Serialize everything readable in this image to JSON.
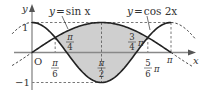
{
  "figure": {
    "type": "function-graph",
    "curves": [
      {
        "name": "sin",
        "label": "y = sin x",
        "label_y": "y",
        "label_eq": "=",
        "label_fn": "sin x"
      },
      {
        "name": "cos2",
        "label": "y = cos 2x",
        "label_y": "y",
        "label_eq": "=",
        "label_fn": "cos 2x"
      }
    ],
    "axes": {
      "x_label": "x",
      "y_label": "y",
      "origin_label": "O"
    },
    "y_ticks": [
      {
        "value": 1,
        "label": "1"
      },
      {
        "value": -1,
        "label": "−1"
      }
    ],
    "x_ticks": [
      {
        "value": "pi/6",
        "num": "π",
        "den": "6"
      },
      {
        "value": "pi/2",
        "num": "π",
        "den": "2"
      },
      {
        "value": "5pi/6",
        "num": "5",
        "den": "6",
        "suffix": "π"
      },
      {
        "value": "pi",
        "label": "π"
      }
    ],
    "region_labels": [
      {
        "value": "pi/4",
        "num": "π",
        "den": "4"
      },
      {
        "value": "3pi/4",
        "num": "3",
        "den": "4",
        "suffix": "π"
      }
    ],
    "shaded_region": "sin x ≥ cos 2x on [π/6, 5π/6]",
    "colors": {
      "curve": "#222222",
      "shade": "#cfcfcf",
      "axis": "#888888",
      "dash": "#555555"
    }
  }
}
